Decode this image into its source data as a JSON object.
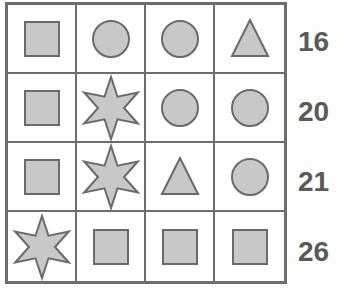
{
  "puzzle": {
    "fill_color": "#c8c8c8",
    "stroke_color": "#6a6a6a",
    "rows": [
      {
        "shapes": [
          "square",
          "circle",
          "circle",
          "triangle"
        ],
        "sum": "16"
      },
      {
        "shapes": [
          "square",
          "star",
          "circle",
          "circle"
        ],
        "sum": "20"
      },
      {
        "shapes": [
          "square",
          "star",
          "triangle",
          "circle"
        ],
        "sum": "21"
      },
      {
        "shapes": [
          "star",
          "square",
          "square",
          "square"
        ],
        "sum": "26"
      }
    ]
  }
}
